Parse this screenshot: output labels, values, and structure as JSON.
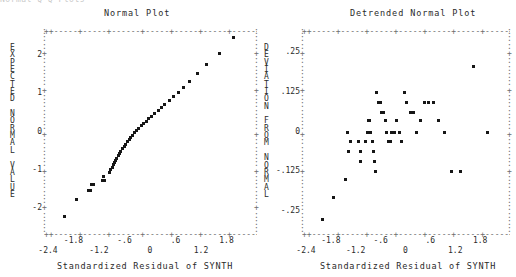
{
  "window": {
    "clipped_header_text": "Normal Q-Q Plots"
  },
  "left_plot": {
    "title": "Normal Plot",
    "y_axis_title_chars": "E\nX\nP\nE\nC\nT\nE\nD\n \nN\nO\nR\nM\nA\nL\n \nV\nA\nL\nU\nE",
    "x_caption": "Standardized Residual of SYNTH",
    "y_ticks": [
      "2",
      "1",
      "0",
      "-1",
      "-2"
    ],
    "x_ticks_upper": [
      "-1.8",
      "-.6",
      ".6",
      "1.8"
    ],
    "x_ticks_lower": [
      "-2.4",
      "-1.2",
      "0",
      "1.2"
    ]
  },
  "right_plot": {
    "title": "Detrended Normal Plot",
    "y_axis_title_chars": "D\nE\nV\nI\nA\nT\nI\nO\nN\n \nF\nR\nO\nM\n \nN\nO\nR\nM\nA\nL",
    "x_caption": "Standardized Residual of SYNTH",
    "y_ticks": [
      ".25",
      ".125",
      "0",
      "-.125",
      "-.25"
    ],
    "x_ticks_upper": [
      "-1.8",
      "-.6",
      ".6",
      "1.8"
    ],
    "x_ticks_lower": [
      "-2.4",
      "-1.2",
      "0",
      "1.2"
    ]
  },
  "chart_data": [
    {
      "type": "scatter",
      "title": "Normal Plot",
      "xlabel": "Standardized Residual of SYNTH",
      "ylabel": "EXPECTED NORMAL VALUE",
      "xlim": [
        -2.4,
        2.4
      ],
      "ylim": [
        -2.6,
        2.6
      ],
      "grid": false,
      "legend": "none",
      "x": [
        -2.02,
        -1.74,
        -1.47,
        -1.42,
        -1.38,
        -1.35,
        -1.14,
        -1.1,
        -1.09,
        -0.97,
        -0.93,
        -0.9,
        -0.88,
        -0.85,
        -0.82,
        -0.79,
        -0.76,
        -0.73,
        -0.7,
        -0.66,
        -0.62,
        -0.58,
        -0.54,
        -0.5,
        -0.46,
        -0.42,
        -0.38,
        -0.34,
        -0.28,
        -0.22,
        -0.16,
        -0.1,
        -0.04,
        0.02,
        0.1,
        0.18,
        0.26,
        0.34,
        0.44,
        0.54,
        0.66,
        0.78,
        0.92,
        1.1,
        1.32,
        1.62,
        1.96
      ],
      "y": [
        -2.22,
        -1.76,
        -1.52,
        -1.52,
        -1.36,
        -1.36,
        -1.27,
        -1.15,
        -1.27,
        -1.05,
        -0.99,
        -0.93,
        -0.86,
        -0.8,
        -0.74,
        -0.68,
        -0.62,
        -0.56,
        -0.5,
        -0.44,
        -0.38,
        -0.32,
        -0.26,
        -0.2,
        -0.14,
        -0.08,
        -0.02,
        0.04,
        0.1,
        0.16,
        0.22,
        0.28,
        0.34,
        0.4,
        0.48,
        0.56,
        0.64,
        0.72,
        0.82,
        0.92,
        1.04,
        1.16,
        1.32,
        1.52,
        1.76,
        2.06,
        2.46
      ]
    },
    {
      "type": "scatter",
      "title": "Detrended Normal Plot",
      "xlabel": "Standardized Residual of SYNTH",
      "ylabel": "DEVIATION FROM NORMAL",
      "xlim": [
        -2.4,
        2.4
      ],
      "ylim": [
        -0.3125,
        0.3125
      ],
      "grid": false,
      "legend": "none",
      "x": [
        -2.02,
        -1.74,
        -1.47,
        -1.42,
        -1.38,
        -1.35,
        -1.14,
        -1.1,
        -1.09,
        -0.97,
        -0.93,
        -0.9,
        -0.88,
        -0.85,
        -0.82,
        -0.79,
        -0.76,
        -0.73,
        -0.7,
        -0.66,
        -0.62,
        -0.58,
        -0.54,
        -0.5,
        -0.46,
        -0.42,
        -0.38,
        -0.34,
        -0.28,
        -0.22,
        -0.16,
        -0.1,
        -0.04,
        0.02,
        0.1,
        0.18,
        0.26,
        0.34,
        0.44,
        0.54,
        0.66,
        0.78,
        0.92,
        1.1,
        1.32,
        1.62,
        1.96
      ],
      "y": [
        -0.275,
        -0.205,
        -0.15,
        0.0,
        -0.062,
        -0.03,
        -0.03,
        -0.062,
        -0.092,
        -0.03,
        0.0,
        0.035,
        0.035,
        0.0,
        -0.03,
        -0.062,
        -0.092,
        -0.125,
        0.125,
        0.092,
        0.092,
        0.062,
        0.062,
        0.035,
        0.0,
        -0.03,
        -0.03,
        0.0,
        0.0,
        0.035,
        0.0,
        -0.03,
        0.125,
        0.092,
        0.062,
        0.062,
        0.0,
        0.035,
        0.092,
        0.092,
        0.092,
        0.035,
        0.0,
        -0.125,
        -0.125,
        0.205,
        0.0
      ]
    }
  ]
}
